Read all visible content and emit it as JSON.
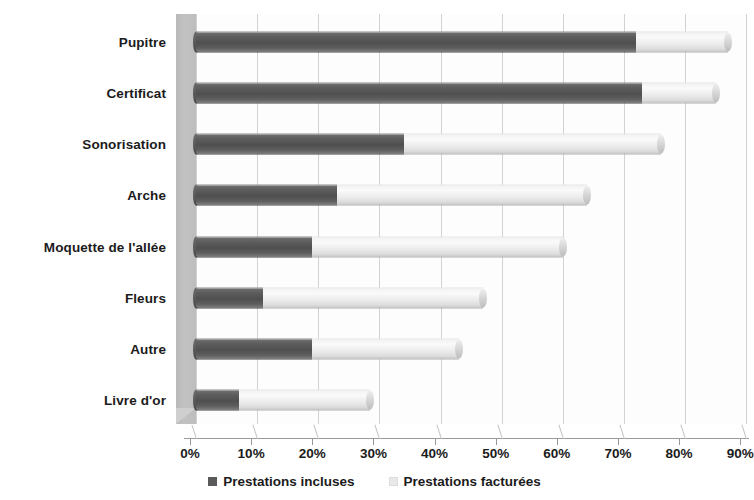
{
  "chart_data": {
    "type": "bar",
    "orientation": "horizontal",
    "stacked": true,
    "title": "",
    "subtitle": "",
    "xlabel": "",
    "ylabel": "",
    "xlim": [
      0,
      90
    ],
    "grid": true,
    "legend_position": "bottom",
    "xticklabels": [
      "0%",
      "10%",
      "20%",
      "30%",
      "40%",
      "50%",
      "60%",
      "70%",
      "80%",
      "90%"
    ],
    "xticks": [
      0,
      10,
      20,
      30,
      40,
      50,
      60,
      70,
      80,
      90
    ],
    "categories": [
      "Pupitre",
      "Certificat",
      "Sonorisation",
      "Arche",
      "Moquette de l'allée",
      "Fleurs",
      "Autre",
      "Livre d'or"
    ],
    "series": [
      {
        "name": "Prestations incluses",
        "color": "#5a5a5a",
        "values": [
          72,
          73,
          34,
          23,
          19,
          11,
          19,
          7
        ]
      },
      {
        "name": "Prestations facturées",
        "color": "#e9e9e9",
        "values": [
          15,
          12,
          42,
          41,
          41,
          36,
          24,
          21.5
        ]
      }
    ],
    "totals": [
      87,
      85,
      76,
      64,
      60,
      47,
      43,
      28.5
    ]
  },
  "legend": {
    "items": [
      {
        "label": "Prestations incluses",
        "swatch": "dark"
      },
      {
        "label": "Prestations facturées",
        "swatch": "light"
      }
    ]
  },
  "colors": {
    "included": "#5a5a5a",
    "billed": "#e9e9e9",
    "gridline": "#d2d2d2",
    "wall": "#c2c2c2",
    "text": "#1b1b1b"
  }
}
